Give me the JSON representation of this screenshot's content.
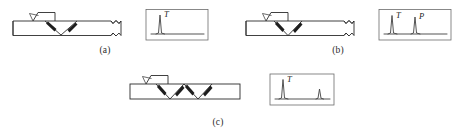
{
  "figure": {
    "panels": [
      {
        "id": "a",
        "caption": "(a)",
        "beam_path": "single-V",
        "probe": "angle-beam-transducer",
        "break_symbol": true,
        "scope": {
          "peaks": [
            {
              "label": "T",
              "position": 0.16,
              "height": 0.86
            }
          ],
          "baseline": true
        }
      },
      {
        "id": "b",
        "caption": "(b)",
        "beam_path": "single-V-narrow",
        "probe": "angle-beam-transducer",
        "break_symbol": true,
        "scope": {
          "peaks": [
            {
              "label": "T",
              "position": 0.17,
              "height": 0.82
            },
            {
              "label": "P",
              "position": 0.55,
              "height": 0.74
            }
          ],
          "baseline": true
        }
      },
      {
        "id": "c",
        "caption": "(c)",
        "beam_path": "double-V",
        "probe": "angle-beam-transducer",
        "break_symbol": false,
        "scope": {
          "peaks": [
            {
              "label": "T",
              "position": 0.14,
              "height": 0.88
            },
            {
              "label": "",
              "position": 0.8,
              "height": 0.42
            }
          ],
          "baseline": true
        }
      }
    ],
    "labels": {
      "transmission_pulse": "T",
      "defect_echo": "P"
    },
    "colors": {
      "line": "#2b2b2b",
      "trace": "#4a4a4a",
      "box": "#6b6b6b",
      "background": "#ffffff"
    }
  }
}
